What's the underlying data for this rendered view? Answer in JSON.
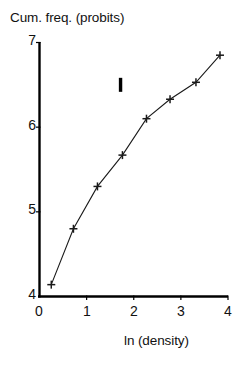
{
  "chart_data": {
    "type": "line",
    "title": "",
    "xlabel": "ln (density)",
    "ylabel": "Cum. freq. (probits)",
    "xlim": [
      0,
      4
    ],
    "ylim": [
      4,
      7
    ],
    "xticks": [
      "0",
      "1",
      "2",
      "3",
      "4"
    ],
    "xtick_values": [
      0,
      1,
      2,
      3,
      4
    ],
    "yticks": [
      "4",
      "5",
      "6",
      "7"
    ],
    "ytick_values": [
      4,
      5,
      6,
      7
    ],
    "grid": false,
    "legend": "none",
    "marker": "plus",
    "line_color": "#1a1a1a",
    "axis_color": "#000000",
    "x": [
      0.25,
      0.72,
      1.23,
      1.76,
      2.27,
      2.77,
      3.32,
      3.83
    ],
    "y": [
      4.14,
      4.8,
      5.3,
      5.67,
      6.1,
      6.33,
      6.53,
      6.85
    ],
    "series": [
      {
        "name": "I",
        "points": [
          [
            0.25,
            4.14
          ],
          [
            0.72,
            4.8
          ],
          [
            1.23,
            5.3
          ],
          [
            1.76,
            5.67
          ],
          [
            2.27,
            6.1
          ],
          [
            2.77,
            6.33
          ],
          [
            3.32,
            6.53
          ],
          [
            3.83,
            6.85
          ]
        ]
      }
    ],
    "annotations": [
      {
        "text": "I",
        "x": 1.72,
        "y": 6.5,
        "style": "bold-vertical-bar"
      }
    ]
  },
  "axis_titles": {
    "y": "Cum. freq. (probits)",
    "x": "ln (density)"
  },
  "tick_labels": {
    "y": [
      "7",
      "6",
      "5",
      "4"
    ],
    "x": [
      "0",
      "1",
      "2",
      "3",
      "4"
    ]
  },
  "panel_label": "I"
}
